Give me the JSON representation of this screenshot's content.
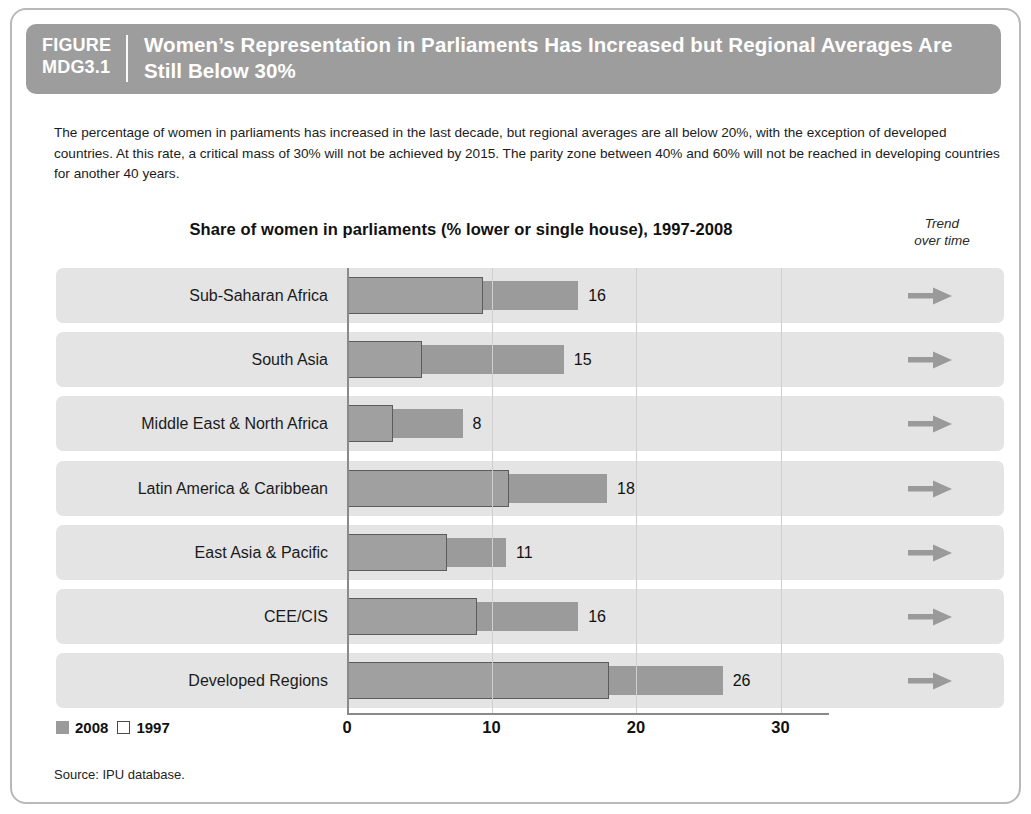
{
  "figure": {
    "tag_line1": "FIGURE",
    "tag_line2": "MDG3.1",
    "title": "Women’s Representation in Parliaments Has Increased but Regional Averages Are Still Below 30%",
    "description": "The percentage of women in parliaments has increased in the last decade, but regional averages are all below 20%, with the exception of developed countries. At this rate, a critical mass of 30% will not be achieved by 2015. The parity zone between 40% and 60% will not be reached in developing countries for another 40 years.",
    "source": "Source: IPU database.",
    "trend_header_line1": "Trend",
    "trend_header_line2": "over time"
  },
  "colors": {
    "banner": "#9d9d9d",
    "bar_2008": "#9b9b9b",
    "bar_1997_fill": "#a0a0a0",
    "bar_1997_stroke": "#5c5c5c",
    "row_band": "#e4e4e4",
    "gridline": "#cfcfcf",
    "axis": "#8a8a8a",
    "arrow": "#9a9a9a",
    "frame": "#b9b9b9"
  },
  "chart_data": {
    "type": "bar",
    "title": "Share of women in parliaments (% lower or single house), 1997-2008",
    "xlabel": "",
    "ylabel": "",
    "xlim": [
      0,
      33
    ],
    "ticks": [
      0,
      10,
      20,
      30
    ],
    "tick_labels": [
      "0",
      "10",
      "20",
      "30"
    ],
    "grid": true,
    "orientation": "horizontal",
    "legend": [
      {
        "name": "2008",
        "style": "filled"
      },
      {
        "name": "1997",
        "style": "hollow"
      }
    ],
    "legend_position": "bottom-left",
    "categories": [
      "Sub-Saharan Africa",
      "South Asia",
      "Middle East & North Africa",
      "Latin America & Caribbean",
      "East Asia & Pacific",
      "CEE/CIS",
      "Developed Regions"
    ],
    "series": [
      {
        "name": "2008",
        "values": [
          16,
          15,
          8,
          18,
          11,
          16,
          26
        ]
      },
      {
        "name": "1997",
        "values": [
          9.4,
          5.2,
          3.2,
          11.2,
          6.9,
          9.0,
          18.1
        ]
      }
    ],
    "value_labels": [
      "16",
      "15",
      "8",
      "18",
      "11",
      "16",
      "26"
    ],
    "trend": [
      "flat",
      "flat",
      "flat",
      "flat",
      "flat",
      "flat",
      "flat"
    ],
    "trend_icon": "arrow-right-icon"
  }
}
